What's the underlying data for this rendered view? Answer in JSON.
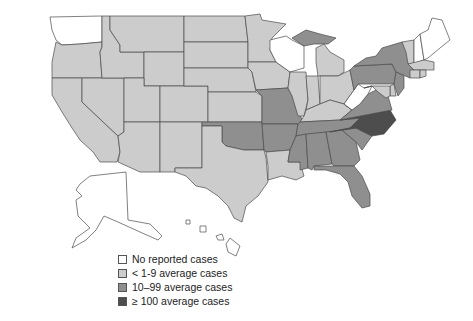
{
  "map": {
    "title": "",
    "colors": {
      "none": "#ffffff",
      "low": "#cccccc",
      "medium": "#8f8f8f",
      "high": "#4d4d4d"
    },
    "states": {
      "WA": "none",
      "OR": "low",
      "CA": "low",
      "NV": "low",
      "ID": "low",
      "MT": "low",
      "WY": "low",
      "UT": "low",
      "AZ": "low",
      "CO": "low",
      "NM": "low",
      "ND": "low",
      "SD": "low",
      "NE": "low",
      "KS": "low",
      "OK": "medium",
      "TX": "low",
      "MN": "low",
      "IA": "low",
      "MO": "medium",
      "AR": "medium",
      "LA": "low",
      "WI": "none",
      "MI_UP": "medium",
      "MI": "low",
      "IL": "low",
      "IN": "low",
      "OH": "low",
      "KY": "low",
      "TN": "medium",
      "MS": "medium",
      "AL": "medium",
      "GA": "medium",
      "FL": "medium",
      "SC": "medium",
      "NC": "high",
      "VA": "medium",
      "WV": "none",
      "PA": "medium",
      "NY": "medium",
      "VT": "low",
      "NH": "none",
      "ME": "none",
      "MA": "low",
      "CT": "low",
      "RI": "low",
      "NJ": "medium",
      "DE": "low",
      "MD": "low",
      "AK": "none",
      "HI": "none"
    }
  },
  "legend": {
    "items": [
      {
        "label": "No reported cases",
        "level": "none"
      },
      {
        "label": "< 1-9 average cases",
        "level": "low"
      },
      {
        "label": "10–99 average cases",
        "level": "medium"
      },
      {
        "label": "≥ 100 average cases",
        "level": "high"
      }
    ]
  }
}
